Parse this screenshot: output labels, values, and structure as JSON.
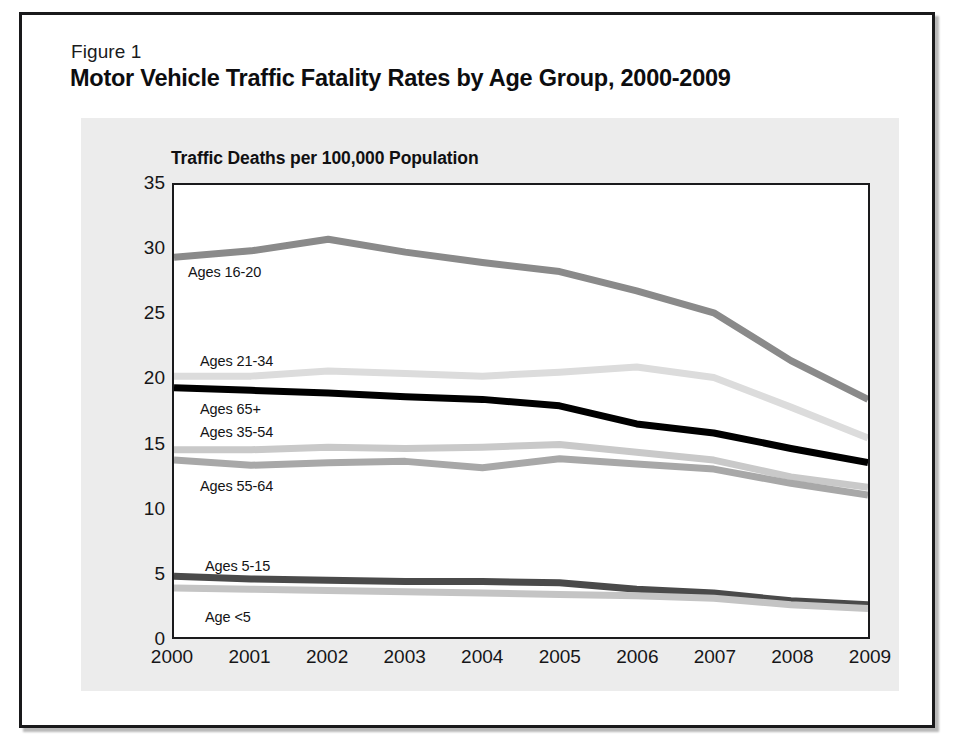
{
  "figure": {
    "number": "Figure 1",
    "title": "Motor Vehicle Traffic Fatality Rates by Age Group, 2000-2009"
  },
  "colors": {
    "frame": "#19191b",
    "card_background": "#ffffff",
    "panel_background": "#ececec",
    "plot_background": "#ffffff",
    "axis": "#1a1a1c",
    "text": "#141416",
    "series_16_20": "#8a8a8a",
    "series_21_34": "#dcdcdc",
    "series_65_plus": "#000000",
    "series_35_54": "#c9c9c9",
    "series_55_64": "#a8a8a8",
    "series_5_15": "#4a4a4a",
    "series_under_5": "#c4c4c4"
  },
  "chart_data": {
    "type": "line",
    "title": "Motor Vehicle Traffic Fatality Rates by Age Group, 2000-2009",
    "subtitle": "Figure 1",
    "ylabel": "Traffic Deaths per 100,000 Population",
    "xlabel": "",
    "x": [
      2000,
      2001,
      2002,
      2003,
      2004,
      2005,
      2006,
      2007,
      2008,
      2009
    ],
    "xticklabels": [
      "2000",
      "2001",
      "2002",
      "2003",
      "2004",
      "2005",
      "2006",
      "2007",
      "2008",
      "2009"
    ],
    "yticklabels": [
      "0",
      "5",
      "10",
      "15",
      "20",
      "25",
      "30",
      "35"
    ],
    "yticks": [
      0,
      5,
      10,
      15,
      20,
      25,
      30,
      35
    ],
    "ylim": [
      0,
      35
    ],
    "xlim": [
      2000,
      2009
    ],
    "grid": false,
    "legend": "inline-labels",
    "series": [
      {
        "name": "Ages 16-20",
        "color": "#8a8a8a",
        "values": [
          29.4,
          29.9,
          30.8,
          29.8,
          29.0,
          28.3,
          26.8,
          25.1,
          21.4,
          18.4
        ]
      },
      {
        "name": "Ages 21-34",
        "color": "#dcdcdc",
        "values": [
          20.2,
          20.2,
          20.6,
          20.4,
          20.2,
          20.5,
          20.9,
          20.1,
          17.8,
          15.4
        ]
      },
      {
        "name": "Ages 65+",
        "color": "#000000",
        "values": [
          19.3,
          19.1,
          18.9,
          18.6,
          18.4,
          17.9,
          16.5,
          15.8,
          14.6,
          13.5
        ]
      },
      {
        "name": "Ages 35-54",
        "color": "#c9c9c9",
        "values": [
          14.5,
          14.5,
          14.7,
          14.6,
          14.7,
          14.9,
          14.3,
          13.7,
          12.4,
          11.6
        ]
      },
      {
        "name": "Ages 55-64",
        "color": "#a8a8a8",
        "values": [
          13.7,
          13.3,
          13.5,
          13.6,
          13.1,
          13.8,
          13.4,
          13.0,
          11.9,
          11.0
        ]
      },
      {
        "name": "Ages 5-15",
        "color": "#4a4a4a",
        "values": [
          4.7,
          4.5,
          4.4,
          4.3,
          4.3,
          4.2,
          3.7,
          3.4,
          2.8,
          2.5
        ]
      },
      {
        "name": "Age <5",
        "color": "#c4c4c4",
        "values": [
          3.8,
          3.7,
          3.6,
          3.5,
          3.4,
          3.3,
          3.2,
          3.0,
          2.5,
          2.2
        ]
      }
    ],
    "series_labels": [
      {
        "text": "Ages 16-20",
        "x": 166,
        "y": 249
      },
      {
        "text": "Ages 21-34",
        "x": 178,
        "y": 338
      },
      {
        "text": "Ages 65+",
        "x": 178,
        "y": 386
      },
      {
        "text": "Ages 35-54",
        "x": 178,
        "y": 409
      },
      {
        "text": "Ages 55-64",
        "x": 178,
        "y": 463
      },
      {
        "text": "Ages 5-15",
        "x": 183,
        "y": 543
      },
      {
        "text": "Age <5",
        "x": 183,
        "y": 594
      }
    ]
  }
}
